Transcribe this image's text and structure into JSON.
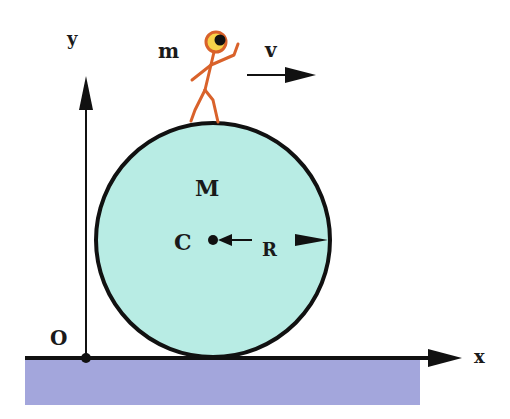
{
  "diagram": {
    "labels": {
      "y_axis": "y",
      "x_axis": "x",
      "origin": "O",
      "person_mass": "m",
      "velocity": "v",
      "cylinder_mass": "M",
      "center": "C",
      "radius": "R"
    },
    "colors": {
      "cylinder_fill": "#b8ece4",
      "ground_fill": "#a3a6dc",
      "outline": "#111111",
      "person": "#d9622b",
      "person_head_inner": "#f7d24a"
    },
    "icons": {
      "person": "stick-figure-walking",
      "velocity_arrow": "arrow-right",
      "radius_arrow": "double-arrow"
    }
  }
}
